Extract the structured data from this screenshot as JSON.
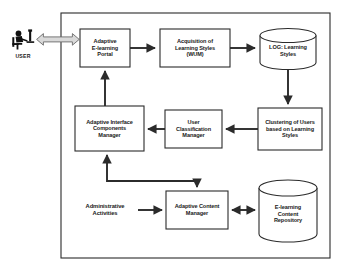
{
  "diagram": {
    "background_color": "#ffffff",
    "stroke_color": "#2b2b2b",
    "text_color": "#1a1a1a",
    "container": {
      "name": "system-boundary",
      "x": 61,
      "y": 13,
      "width": 269,
      "height": 245
    },
    "actor": {
      "icon": "user-at-desk-icon",
      "label": "USER",
      "x": 10,
      "y": 28,
      "width": 30,
      "height": 24
    },
    "nodes": [
      {
        "id": "portal",
        "shape": "box",
        "label": "Adaptive\nE-learning\nPortal",
        "x": 80,
        "y": 29,
        "width": 50,
        "height": 38
      },
      {
        "id": "acquisition",
        "shape": "box",
        "label": "Acquisition of\nLearning Styles\n(WUM)",
        "x": 160,
        "y": 29,
        "width": 70,
        "height": 38
      },
      {
        "id": "log_store",
        "shape": "cylinder",
        "label": "LOG: Learning\nStyles",
        "x": 260,
        "y": 28,
        "width": 56,
        "height": 42
      },
      {
        "id": "clustering",
        "shape": "box",
        "label": "Clustering of Users\nbased on Learning\nStyles",
        "x": 258,
        "y": 108,
        "width": 64,
        "height": 42
      },
      {
        "id": "classification",
        "shape": "box",
        "label": "User\nClassification\nManager",
        "x": 165,
        "y": 110,
        "width": 57,
        "height": 38
      },
      {
        "id": "interface_manager",
        "shape": "box",
        "label": "Adaptive Interface\nComponents\nManager",
        "x": 75,
        "y": 106,
        "width": 69,
        "height": 45
      },
      {
        "id": "content_manager",
        "shape": "box",
        "label": "Adaptive Content\nManager",
        "x": 166,
        "y": 191,
        "width": 62,
        "height": 38
      },
      {
        "id": "content_repo",
        "shape": "cylinder",
        "label": "E-learning\nContent\nRepository",
        "x": 258,
        "y": 180,
        "width": 58,
        "height": 62
      },
      {
        "id": "admin_activities",
        "shape": "plain-text",
        "label": "Administrative\nActivities",
        "x": 73,
        "y": 198,
        "width": 62,
        "height": 24
      }
    ],
    "connectors": [
      {
        "id": "user-portal",
        "from": "actor",
        "to": "portal",
        "style": "hollow-double-arrow",
        "direction": "both"
      },
      {
        "id": "portal-acquisition",
        "from": "portal",
        "to": "acquisition",
        "style": "solid-arrow",
        "direction": "forward"
      },
      {
        "id": "acquisition-log",
        "from": "acquisition",
        "to": "log_store",
        "style": "solid-arrow",
        "direction": "forward"
      },
      {
        "id": "log-clustering",
        "from": "log_store",
        "to": "clustering",
        "style": "solid-arrow",
        "direction": "forward"
      },
      {
        "id": "clustering-classification",
        "from": "clustering",
        "to": "classification",
        "style": "solid-arrow",
        "direction": "forward"
      },
      {
        "id": "classification-interface",
        "from": "classification",
        "to": "interface_manager",
        "style": "solid-arrow",
        "direction": "forward"
      },
      {
        "id": "interface-portal",
        "from": "interface_manager",
        "to": "portal",
        "style": "solid-arrow",
        "direction": "forward"
      },
      {
        "id": "interface-content-manager",
        "from": "interface_manager",
        "to": "content_manager",
        "style": "solid-elbow-arrow",
        "direction": "both"
      },
      {
        "id": "admin-content-manager",
        "from": "admin_activities",
        "to": "content_manager",
        "style": "solid-arrow",
        "direction": "forward"
      },
      {
        "id": "content-manager-repo",
        "from": "content_manager",
        "to": "content_repo",
        "style": "solid-arrow",
        "direction": "both"
      }
    ]
  }
}
